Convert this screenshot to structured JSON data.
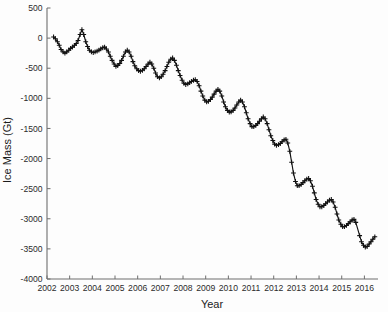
{
  "chart_data": {
    "type": "line",
    "title": "",
    "xlabel": "Year",
    "ylabel": "Ice Mass (Gt)",
    "xlim": [
      2002,
      2016.6
    ],
    "ylim": [
      -4000,
      500
    ],
    "yticks": [
      500,
      0,
      -500,
      -1000,
      -1500,
      -2000,
      -2500,
      -3000,
      -3500,
      -4000
    ],
    "ytick_labels": [
      "500",
      "0",
      "-500",
      "-1000",
      "-1500",
      "-2000",
      "-2500",
      "-3000",
      "-3500",
      "-4000"
    ],
    "xticks": [
      2002,
      2003,
      2004,
      2005,
      2006,
      2007,
      2008,
      2009,
      2010,
      2011,
      2012,
      2013,
      2014,
      2015,
      2016
    ],
    "xtick_labels": [
      "2002",
      "2003",
      "2004",
      "2005",
      "2006",
      "2007",
      "2008",
      "2009",
      "2010",
      "2011",
      "2012",
      "2013",
      "2014",
      "2015",
      "2016"
    ],
    "grid": false,
    "legend": null,
    "marker": "plus",
    "line_color": "#111111",
    "marker_color": "#111111",
    "series": [
      {
        "name": "Ice Mass Anomaly",
        "units": "Gt",
        "x": [
          2002.29,
          2002.37,
          2002.46,
          2002.54,
          2002.62,
          2002.71,
          2002.79,
          2002.87,
          2002.96,
          2003.04,
          2003.12,
          2003.21,
          2003.29,
          2003.37,
          2003.46,
          2003.54,
          2003.62,
          2003.71,
          2003.79,
          2003.87,
          2003.96,
          2004.04,
          2004.12,
          2004.21,
          2004.29,
          2004.37,
          2004.46,
          2004.54,
          2004.62,
          2004.71,
          2004.79,
          2004.87,
          2004.96,
          2005.04,
          2005.12,
          2005.21,
          2005.29,
          2005.37,
          2005.46,
          2005.54,
          2005.62,
          2005.71,
          2005.79,
          2005.87,
          2005.96,
          2006.04,
          2006.12,
          2006.21,
          2006.29,
          2006.37,
          2006.46,
          2006.54,
          2006.62,
          2006.71,
          2006.79,
          2006.87,
          2006.96,
          2007.04,
          2007.12,
          2007.21,
          2007.29,
          2007.37,
          2007.46,
          2007.54,
          2007.62,
          2007.71,
          2007.79,
          2007.87,
          2007.96,
          2008.04,
          2008.12,
          2008.21,
          2008.29,
          2008.37,
          2008.46,
          2008.54,
          2008.62,
          2008.71,
          2008.79,
          2008.87,
          2008.96,
          2009.04,
          2009.12,
          2009.21,
          2009.29,
          2009.37,
          2009.46,
          2009.54,
          2009.62,
          2009.71,
          2009.79,
          2009.87,
          2009.96,
          2010.04,
          2010.12,
          2010.21,
          2010.29,
          2010.37,
          2010.46,
          2010.54,
          2010.62,
          2010.71,
          2010.79,
          2010.87,
          2010.96,
          2011.04,
          2011.12,
          2011.21,
          2011.29,
          2011.37,
          2011.46,
          2011.54,
          2011.62,
          2011.71,
          2011.79,
          2011.87,
          2011.96,
          2012.04,
          2012.12,
          2012.21,
          2012.29,
          2012.37,
          2012.46,
          2012.54,
          2012.62,
          2012.71,
          2012.79,
          2012.87,
          2012.96,
          2013.04,
          2013.12,
          2013.21,
          2013.29,
          2013.37,
          2013.46,
          2013.54,
          2013.62,
          2013.71,
          2013.79,
          2013.87,
          2013.96,
          2014.04,
          2014.12,
          2014.21,
          2014.29,
          2014.37,
          2014.46,
          2014.54,
          2014.62,
          2014.71,
          2014.79,
          2014.87,
          2014.96,
          2015.04,
          2015.12,
          2015.21,
          2015.29,
          2015.37,
          2015.46,
          2015.54,
          2015.62,
          2015.79,
          2015.87,
          2015.96,
          2016.04,
          2016.12,
          2016.21,
          2016.29,
          2016.37,
          2016.46
        ],
        "y": [
          20,
          -10,
          -60,
          -120,
          -190,
          -230,
          -250,
          -230,
          -200,
          -170,
          -150,
          -120,
          -90,
          -40,
          60,
          140,
          60,
          -60,
          -140,
          -200,
          -230,
          -240,
          -230,
          -215,
          -200,
          -180,
          -160,
          -150,
          -180,
          -230,
          -300,
          -370,
          -430,
          -470,
          -455,
          -420,
          -370,
          -300,
          -230,
          -200,
          -230,
          -300,
          -390,
          -460,
          -510,
          -540,
          -550,
          -535,
          -510,
          -470,
          -430,
          -400,
          -430,
          -500,
          -580,
          -640,
          -660,
          -640,
          -600,
          -540,
          -470,
          -400,
          -350,
          -330,
          -370,
          -450,
          -540,
          -620,
          -700,
          -750,
          -770,
          -760,
          -740,
          -720,
          -700,
          -690,
          -720,
          -790,
          -880,
          -960,
          -1030,
          -1060,
          -1050,
          -1020,
          -980,
          -930,
          -880,
          -850,
          -880,
          -960,
          -1060,
          -1140,
          -1200,
          -1230,
          -1225,
          -1200,
          -1160,
          -1110,
          -1060,
          -1030,
          -1060,
          -1140,
          -1240,
          -1340,
          -1420,
          -1470,
          -1470,
          -1450,
          -1420,
          -1380,
          -1340,
          -1310,
          -1340,
          -1420,
          -1520,
          -1620,
          -1700,
          -1760,
          -1780,
          -1770,
          -1750,
          -1720,
          -1690,
          -1680,
          -1740,
          -1880,
          -2060,
          -2240,
          -2380,
          -2450,
          -2450,
          -2430,
          -2400,
          -2370,
          -2340,
          -2330,
          -2370,
          -2460,
          -2570,
          -2680,
          -2760,
          -2800,
          -2800,
          -2780,
          -2750,
          -2720,
          -2690,
          -2680,
          -2720,
          -2810,
          -2920,
          -3020,
          -3090,
          -3130,
          -3130,
          -3110,
          -3080,
          -3050,
          -3020,
          -3010,
          -3060,
          -3280,
          -3380,
          -3440,
          -3470,
          -3460,
          -3420,
          -3380,
          -3340,
          -3300
        ]
      }
    ]
  },
  "axis": {
    "xlabel": "Year",
    "ylabel": "Ice Mass (Gt)"
  }
}
